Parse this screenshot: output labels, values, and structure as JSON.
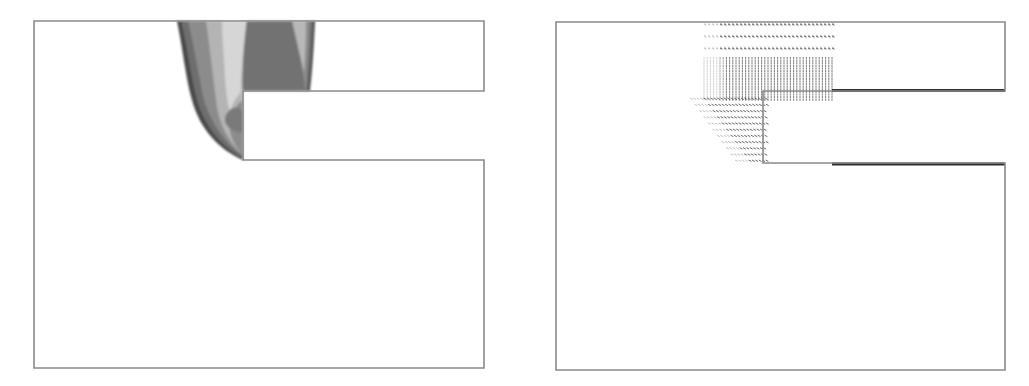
{
  "figure": {
    "panels": [
      {
        "id": "left",
        "kind": "contour-plot",
        "description": "Filled grayscale contour field in L-shaped channel domain, concentrated near inlet and step corner",
        "colors": {
          "outline": "#8a8a8a",
          "level_darkest": "#4a4a4a",
          "level_dark": "#6e6e6e",
          "level_mid": "#8c8c8c",
          "level_light": "#b4b4b4",
          "level_lightest": "#d6d6d6"
        }
      },
      {
        "id": "right",
        "kind": "vector-field",
        "description": "Velocity vector field (arrow glyphs) in same domain, dense near inlet region and step corner; thick walls on right channel",
        "colors": {
          "outline": "#8a8a8a",
          "arrows": "#3a3a3a",
          "thick_wall": "#2e2e2e"
        }
      }
    ]
  }
}
